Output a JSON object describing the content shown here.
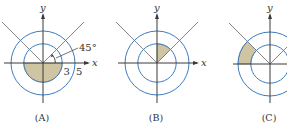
{
  "figures": [
    {
      "id": "A",
      "caption": "(A)",
      "x_label": "x",
      "y_label": "y",
      "angle_label": "45°",
      "radius_labels": [
        "3",
        "5"
      ],
      "inner_radius": 3,
      "outer_radius": 5,
      "region": {
        "r_from": 0,
        "r_to": 3,
        "theta_from_deg": 180,
        "theta_to_deg": 360
      },
      "show_x_label": true,
      "show_y_label": true
    },
    {
      "id": "B",
      "caption": "(B)",
      "x_label": "x",
      "y_label": "y",
      "inner_radius": 3,
      "outer_radius": 5,
      "region": {
        "r_from": 0,
        "r_to": 3,
        "theta_from_deg": 45,
        "theta_to_deg": 90
      },
      "show_x_label": true,
      "show_y_label": true
    },
    {
      "id": "C",
      "caption": "(C)",
      "x_label": "x",
      "y_label": "y",
      "inner_radius": 3,
      "outer_radius": 5,
      "region": {
        "r_from": 3,
        "r_to": 5,
        "theta_from_deg": 135,
        "theta_to_deg": 180
      },
      "show_x_label": false,
      "show_y_label": true
    }
  ],
  "colors": {
    "circle": "#3d7cc0",
    "shade": "#cfc5a3",
    "axis": "#3a3a3a",
    "diagonal": "#7a7a7a"
  }
}
